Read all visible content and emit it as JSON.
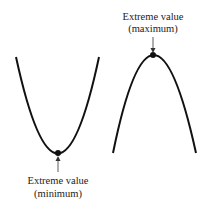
{
  "diagram": {
    "min_curve": {
      "label_line1": "Extreme value",
      "label_line2": "(minimum)"
    },
    "max_curve": {
      "label_line1": "Extreme value",
      "label_line2": "(maximum)"
    },
    "colors": {
      "curve": "#111111",
      "text": "#222222",
      "background": "#ffffff"
    }
  }
}
